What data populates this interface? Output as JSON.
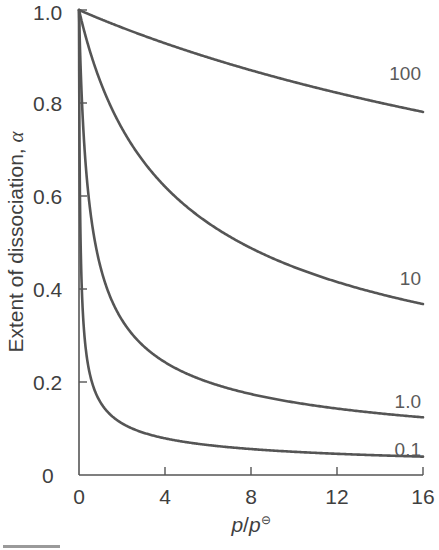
{
  "chart_data": {
    "type": "line",
    "title": "",
    "xlabel": "p/p⊖",
    "xlabel_parts": {
      "var": "p",
      "slash": "/",
      "var2": "p",
      "superscript": "⊖"
    },
    "ylabel": "Extent of dissociation, α",
    "ylabel_parts": {
      "text": "Extent of dissociation, ",
      "symbol": "α"
    },
    "xlim": [
      0,
      16
    ],
    "ylim": [
      0,
      1.0
    ],
    "x_ticks": [
      0,
      4,
      8,
      12,
      16
    ],
    "x_tick_labels": [
      "0",
      "4",
      "8",
      "12",
      "16"
    ],
    "y_ticks": [
      0,
      0.2,
      0.4,
      0.6,
      0.8,
      1.0
    ],
    "y_tick_labels": [
      "0",
      "0.2",
      "0.4",
      "0.6",
      "0.8",
      "1.0"
    ],
    "grid": false,
    "legend": "inline labels at right end of each curve",
    "formula": "alpha = 1 / sqrt(1 + 4 p / K)",
    "x": [
      0,
      0.1,
      0.25,
      0.5,
      1,
      2,
      4,
      6,
      8,
      10,
      12,
      14,
      16
    ],
    "series": [
      {
        "name": "100",
        "label": "100",
        "K": 100,
        "values": [
          1.0,
          0.998,
          0.995,
          0.99,
          0.981,
          0.962,
          0.928,
          0.898,
          0.87,
          0.845,
          0.822,
          0.801,
          0.781
        ]
      },
      {
        "name": "10",
        "label": "10",
        "K": 10,
        "values": [
          1.0,
          0.981,
          0.953,
          0.913,
          0.845,
          0.745,
          0.62,
          0.542,
          0.488,
          0.447,
          0.415,
          0.389,
          0.368
        ]
      },
      {
        "name": "1.0",
        "label": "1.0",
        "K": 1.0,
        "values": [
          1.0,
          0.845,
          0.707,
          0.577,
          0.447,
          0.333,
          0.243,
          0.2,
          0.174,
          0.156,
          0.143,
          0.132,
          0.124
        ]
      },
      {
        "name": "0.1",
        "label": "0.1",
        "K": 0.1,
        "values": [
          1.0,
          0.447,
          0.302,
          0.218,
          0.156,
          0.111,
          0.079,
          0.064,
          0.056,
          0.05,
          0.046,
          0.042,
          0.04
        ]
      }
    ]
  },
  "labels": {
    "y0": "0",
    "y02": "0.2",
    "y04": "0.4",
    "y06": "0.6",
    "y08": "0.8",
    "y10": "1.0",
    "x0": "0",
    "x4": "4",
    "x8": "8",
    "x12": "12",
    "x16": "16",
    "curve100": "100",
    "curve10": "10",
    "curve1": "1.0",
    "curve01": "0.1",
    "ylabel_text": "Extent of dissociation, ",
    "ylabel_symbol": "α",
    "xlabel_p1": "p",
    "xlabel_slash": "/",
    "xlabel_p2": "p",
    "xlabel_sup": "⊖"
  },
  "style": {
    "line_color": "#555555",
    "text_color": "#3f3f3f"
  }
}
